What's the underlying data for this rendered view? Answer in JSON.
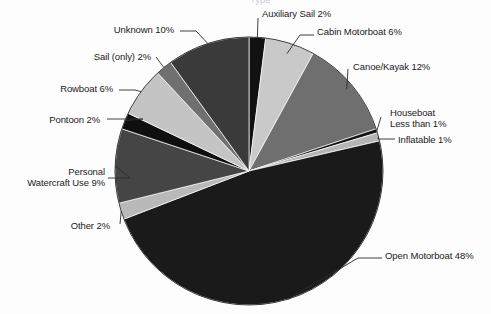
{
  "chart_data": {
    "type": "pie",
    "title": "Type",
    "subtitle": "",
    "xlabel": "",
    "ylabel": "",
    "legend_position": "none",
    "grid": false,
    "total_label": "100%",
    "start_angle_deg": 0,
    "direction": "clockwise",
    "categories": [
      "Auxiliary Sail",
      "Cabin Motorboat",
      "Canoe/Kayak",
      "Houseboat",
      "Inflatable",
      "Open Motorboat",
      "Other",
      "Personal Watercraft Use",
      "Pontoon",
      "Rowboat",
      "Sail (only)",
      "Unknown"
    ],
    "values": [
      2,
      6,
      12,
      0.5,
      1,
      48,
      2,
      9,
      2,
      6,
      2,
      10
    ],
    "value_labels": [
      "2%",
      "6%",
      "12%",
      "Less than 1%",
      "1%",
      "48%",
      "2%",
      "9%",
      "2%",
      "6%",
      "2%",
      "10%"
    ],
    "colors": [
      "#111111",
      "#c9c9c9",
      "#6f6f6f",
      "#141414",
      "#b5b5b5",
      "#1a1a1a",
      "#b9b9b9",
      "#454545",
      "#0f0f0f",
      "#c4c4c4",
      "#707070",
      "#3a3a3a"
    ]
  },
  "slices": [
    {
      "key": "auxiliary-sail",
      "name": "Auxiliary Sail",
      "percent": 2,
      "label": "Auxiliary Sail 2%",
      "color": "#111111"
    },
    {
      "key": "cabin-motorboat",
      "name": "Cabin Motorboat",
      "percent": 6,
      "label": "Cabin Motorboat 6%",
      "color": "#c9c9c9"
    },
    {
      "key": "canoe-kayak",
      "name": "Canoe/Kayak",
      "percent": 12,
      "label": "Canoe/Kayak 12%",
      "color": "#6f6f6f"
    },
    {
      "key": "houseboat",
      "name": "Houseboat",
      "percent": 0.5,
      "label": "Houseboat",
      "label2": "Less than 1%",
      "color": "#141414"
    },
    {
      "key": "inflatable",
      "name": "Inflatable",
      "percent": 1,
      "label": "Inflatable 1%",
      "color": "#b5b5b5"
    },
    {
      "key": "open-motorboat",
      "name": "Open Motorboat",
      "percent": 48,
      "label": "Open Motorboat 48%",
      "color": "#1a1a1a"
    },
    {
      "key": "other",
      "name": "Other",
      "percent": 2,
      "label": "Other 2%",
      "color": "#b9b9b9"
    },
    {
      "key": "personal-watercraft-use",
      "name": "Personal Watercraft Use",
      "percent": 9,
      "label": "Personal",
      "label2": "Watercraft Use 9%",
      "color": "#454545"
    },
    {
      "key": "pontoon",
      "name": "Pontoon",
      "percent": 2,
      "label": "Pontoon 2%",
      "color": "#0f0f0f"
    },
    {
      "key": "rowboat",
      "name": "Rowboat",
      "percent": 6,
      "label": "Rowboat 6%",
      "color": "#c4c4c4"
    },
    {
      "key": "sail-only",
      "name": "Sail (only)",
      "percent": 2,
      "label": "Sail (only) 2%",
      "color": "#707070"
    },
    {
      "key": "unknown",
      "name": "Unknown",
      "percent": 10,
      "label": "Unknown 10%",
      "color": "#3a3a3a"
    }
  ],
  "geometry": {
    "cx": 249,
    "cy": 171,
    "r": 134
  }
}
